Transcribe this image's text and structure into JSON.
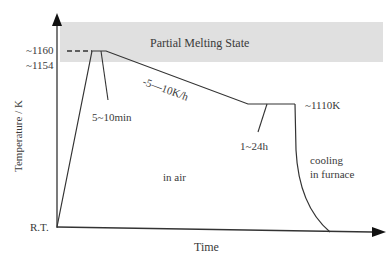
{
  "diagram": {
    "type": "heat-treatment-profile",
    "band": {
      "label": "Partial Melting State",
      "color": "#e0e0e0"
    },
    "y_axis": {
      "label": "Temperature / K",
      "ticks": [
        "~1160",
        "~1154",
        "R.T."
      ]
    },
    "x_axis": {
      "label": "Time"
    },
    "annotations": {
      "hold_peak": "5~10min",
      "cooling_rate": "-5—10K/h",
      "hold_temp": "~1110K",
      "hold_long": "1~24h",
      "environment": "in air",
      "cooling_line1": "cooling",
      "cooling_line2": "in furnace"
    },
    "colors": {
      "line": "#333333",
      "band": "#e0e0e0",
      "text": "#3a3a3a"
    }
  }
}
